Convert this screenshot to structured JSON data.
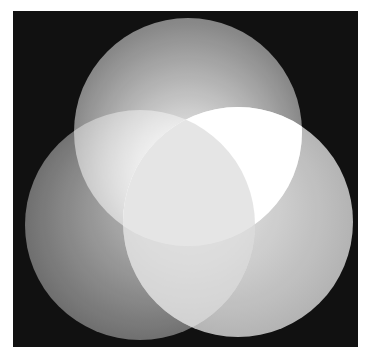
{
  "diagram": {
    "type": "venn-3-circles",
    "background_color": "#111111",
    "page_background": "#ffffff",
    "frame": {
      "x": 13,
      "y": 11,
      "width": 345,
      "height": 336
    },
    "circles": [
      {
        "name": "top",
        "cx": 188,
        "cy": 132,
        "r": 114,
        "inner_color": "#ffffff",
        "outer_color": "#6e6e6e"
      },
      {
        "name": "left",
        "cx": 140,
        "cy": 225,
        "r": 115,
        "inner_color": "#c8c8c8",
        "outer_color": "#5a5a5a"
      },
      {
        "name": "right",
        "cx": 238,
        "cy": 222,
        "r": 115,
        "inner_color": "#e8e8e8",
        "outer_color": "#a8a8a8"
      }
    ],
    "overlap_center_color": "#ffffff",
    "labels": []
  }
}
